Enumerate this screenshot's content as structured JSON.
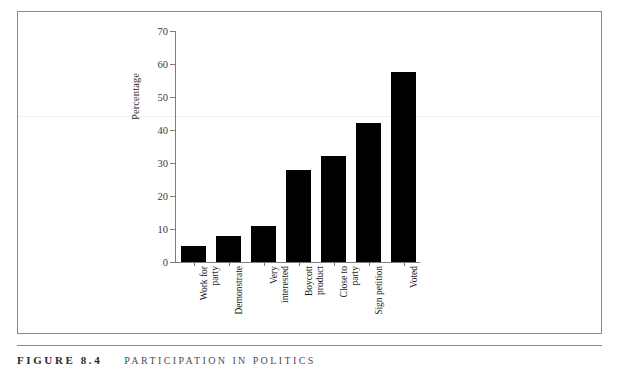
{
  "figure": {
    "caption_number": "FIGURE 8.4",
    "caption_title": "PARTICIPATION IN POLITICS"
  },
  "chart_data": {
    "type": "bar",
    "title": "PARTICIPATION IN POLITICS",
    "xlabel": "",
    "ylabel": "Percentage",
    "ylim": [
      0,
      70
    ],
    "yticks": [
      0,
      10,
      20,
      30,
      40,
      50,
      60,
      70
    ],
    "grid": false,
    "legend": null,
    "bar_color": "#000000",
    "axis_color": "#7d7d7d",
    "categories": [
      "Work for\nparty",
      "Demonstrate",
      "Very\ninterested",
      "Boycott\nproduct",
      "Close to\nparty",
      "Sign petition",
      "Voted"
    ],
    "values": [
      5,
      8,
      11,
      28,
      32,
      42,
      57.5
    ],
    "series": [
      {
        "name": "Percentage",
        "values": [
          5,
          8,
          11,
          28,
          32,
          42,
          57.5
        ]
      }
    ]
  }
}
